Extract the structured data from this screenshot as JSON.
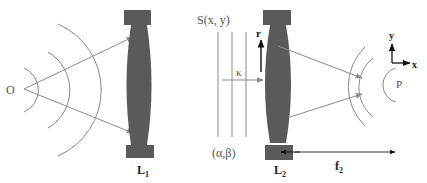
{
  "diagram": {
    "colors": {
      "lens": "#5a5a5a",
      "cap": "#5a5a5a",
      "wave": "#888888",
      "ray": "#8a8a8a",
      "axis_arrow": "#111111",
      "label": "#555555"
    },
    "left_system": {
      "source_label": "O",
      "lens_label_main": "L",
      "lens_label_sub": "1"
    },
    "right_system": {
      "field_label": "S(x, y)",
      "wave_vector_label": "κ",
      "angles_label": "(α,β)",
      "radial_label": "r",
      "lens_label_main": "L",
      "lens_label_sub": "2",
      "focal_label_main": "f",
      "focal_label_sub": "2",
      "focus_label": "P",
      "axis_x_label": "x",
      "axis_y_label": "y"
    }
  }
}
